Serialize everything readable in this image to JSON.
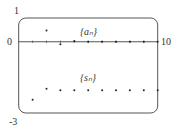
{
  "chart_data": {
    "type": "scatter",
    "title": "",
    "xlabel": "",
    "ylabel": "",
    "xlim": [
      0,
      10
    ],
    "ylim": [
      -3,
      1
    ],
    "grid": false,
    "axis_labels": {
      "y_top": "1",
      "y_bottom": "-3",
      "x_left": "0",
      "x_right": "10"
    },
    "series": [
      {
        "name": "{a_n}",
        "label": "{aₙ}",
        "x": [
          2,
          3,
          4,
          5,
          6,
          7,
          8,
          9,
          10
        ],
        "values": [
          0.47,
          -0.11,
          0.03,
          0.0,
          0.0,
          0.0,
          0.0,
          0.0,
          0.0
        ]
      },
      {
        "name": "{s_n}",
        "label": "{sₙ}",
        "x": [
          1,
          2,
          3,
          4,
          5,
          6,
          7,
          8,
          9,
          10
        ],
        "values": [
          -2.44,
          -1.98,
          -2.04,
          -2.04,
          -2.04,
          -2.04,
          -2.04,
          -2.04,
          -2.04,
          -2.04
        ]
      }
    ],
    "colors": {
      "points": "#222222",
      "frame": "#555555",
      "axis": "#555555"
    }
  }
}
